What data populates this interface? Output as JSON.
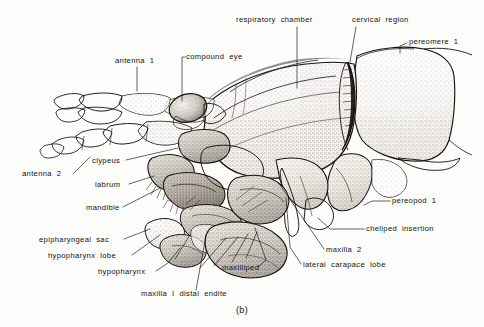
{
  "figure": {
    "caption": "(b)",
    "background_color": "#fdfdfc",
    "ink_color": "#15120f"
  },
  "labels": [
    {
      "id": "respiratory-chamber",
      "text": "respiratory  chamber",
      "x": 236,
      "y": 22,
      "anchor": "start"
    },
    {
      "id": "cervical-region",
      "text": "cervical  region",
      "x": 352,
      "y": 22,
      "anchor": "start"
    },
    {
      "id": "pereomere-1",
      "text": "pereomere  1",
      "x": 409,
      "y": 44,
      "anchor": "start"
    },
    {
      "id": "antenna-1",
      "text": "antenna  1",
      "x": 115,
      "y": 63,
      "anchor": "start"
    },
    {
      "id": "compound-eye",
      "text": "compound  eye",
      "x": 186,
      "y": 59,
      "anchor": "start"
    },
    {
      "id": "antenna-2",
      "text": "antenna  2",
      "x": 22,
      "y": 176,
      "anchor": "start"
    },
    {
      "id": "clypeus",
      "text": "clypeus",
      "x": 92,
      "y": 163,
      "anchor": "start"
    },
    {
      "id": "labrum",
      "text": "labrum",
      "x": 95,
      "y": 187,
      "anchor": "start"
    },
    {
      "id": "mandible",
      "text": "mandible",
      "x": 86,
      "y": 210,
      "anchor": "start"
    },
    {
      "id": "epipharyngeal-sac",
      "text": "epipharyngeal  sac",
      "x": 39,
      "y": 242,
      "anchor": "start"
    },
    {
      "id": "hypopharynx-lobe",
      "text": "hypopharynx  lobe",
      "x": 48,
      "y": 258,
      "anchor": "start"
    },
    {
      "id": "hypopharynx",
      "text": "hypopharynx",
      "x": 98,
      "y": 274,
      "anchor": "start"
    },
    {
      "id": "maxilla-1-distal-endite",
      "text": "maxilla  I  distal  endite",
      "x": 141,
      "y": 296,
      "anchor": "start"
    },
    {
      "id": "maxilliped",
      "text": "maxilliped",
      "x": 222,
      "y": 270,
      "anchor": "start"
    },
    {
      "id": "maxilla-2",
      "text": "maxilla  2",
      "x": 326,
      "y": 252,
      "anchor": "start"
    },
    {
      "id": "lateral-carapace-lobe",
      "text": "lateral  carapace  lobe",
      "x": 303,
      "y": 267,
      "anchor": "start"
    },
    {
      "id": "cheliped-insertion",
      "text": "cheliped  insertion",
      "x": 366,
      "y": 231,
      "anchor": "start"
    },
    {
      "id": "pereopod-1",
      "text": "pereopod  1",
      "x": 392,
      "y": 203,
      "anchor": "start"
    }
  ],
  "leaders": [
    {
      "id": "leader-respiratory-chamber",
      "d": "M 297 27 L 297 88"
    },
    {
      "id": "leader-cervical-region",
      "d": "M 356 27 L 350 62"
    },
    {
      "id": "leader-pereomere-1",
      "d": "M 407 43 L 400 46 L 400 53"
    },
    {
      "id": "leader-antenna-1",
      "d": "M 137 67 L 137 91"
    },
    {
      "id": "leader-compound-eye",
      "d": "M 185 57 L 182 57 L 182 101"
    },
    {
      "id": "leader-antenna-2",
      "d": "M 73 174 L 90 157"
    },
    {
      "id": "leader-clypeus",
      "d": "M 126 160 L 178 148"
    },
    {
      "id": "leader-labrum",
      "d": "M 129 184 L 154 176"
    },
    {
      "id": "leader-mandible",
      "d": "M 123 207 L 160 188"
    },
    {
      "id": "leader-epipharyngeal-sac",
      "d": "M 124 239 L 150 229"
    },
    {
      "id": "leader-hypopharynx-lobe",
      "d": "M 132 255 L 160 235"
    },
    {
      "id": "leader-hypopharynx",
      "d": "M 156 271 L 168 263 L 180 248"
    },
    {
      "id": "leader-maxilla-1",
      "d": "M 196 290 L 206 236"
    },
    {
      "id": "leader-maxilliped",
      "d": "M 258 267 L 266 260 L 255 228"
    },
    {
      "id": "leader-maxilla-2",
      "d": "M 324 249 L 278 182"
    },
    {
      "id": "leader-lateral-carapace",
      "d": "M 301 264 L 290 247 L 286 198"
    },
    {
      "id": "leader-cheliped-insertion",
      "d": "M 364 229 L 330 229 L 318 218"
    },
    {
      "id": "leader-pereopod-1",
      "d": "M 390 201 L 372 201 L 364 205"
    },
    {
      "id": "leader-fan-a",
      "d": "M 200 268 L 226 238"
    },
    {
      "id": "leader-fan-b",
      "d": "M 214 266 L 238 237"
    },
    {
      "id": "leader-fan-c",
      "d": "M 232 262 L 248 234"
    },
    {
      "id": "leader-fan-d",
      "d": "M 246 258 L 257 232"
    },
    {
      "id": "leader-fan-e",
      "d": "M 175 259 L 190 235"
    }
  ]
}
